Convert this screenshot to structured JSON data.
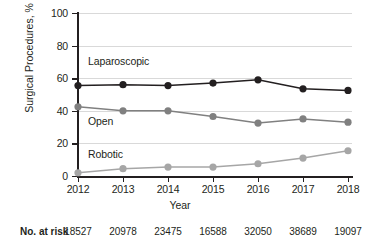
{
  "chart_data": {
    "type": "line",
    "title": "",
    "xlabel": "Year",
    "ylabel": "Surgical Procedures, %",
    "categories": [
      "2012",
      "2013",
      "2014",
      "2015",
      "2016",
      "2017",
      "2018"
    ],
    "xlim": [
      2012,
      2018
    ],
    "ylim": [
      0,
      100
    ],
    "yticks": [
      0,
      20,
      40,
      60,
      80,
      100
    ],
    "ytick_labels": [
      "0",
      "20",
      "40",
      "60",
      "80",
      "100"
    ],
    "grid": "horizontal",
    "legend": "inline-annotations",
    "series": [
      {
        "name": "Laparoscopic",
        "color": "#231f20",
        "values": [
          55.5,
          56.0,
          55.5,
          57.0,
          59.0,
          53.5,
          52.5
        ]
      },
      {
        "name": "Open",
        "color": "#808080",
        "values": [
          42.5,
          40.0,
          40.0,
          36.5,
          32.5,
          35.0,
          33.0
        ]
      },
      {
        "name": "Robotic",
        "color": "#a6a6a6",
        "values": [
          2.0,
          4.5,
          5.5,
          5.5,
          7.5,
          11.0,
          15.5
        ]
      }
    ],
    "annotations": [
      {
        "text": "Laparoscopic",
        "series": "Laparoscopic"
      },
      {
        "text": "Open",
        "series": "Open"
      },
      {
        "text": "Robotic",
        "series": "Robotic"
      }
    ]
  },
  "risk_table": {
    "label": "No. at risk",
    "values": [
      "18527",
      "20978",
      "23475",
      "16588",
      "32050",
      "38689",
      "19097"
    ]
  },
  "colors": {
    "axis": "#231f20",
    "grid": "#d9d9d9",
    "laparoscopic": "#231f20",
    "open": "#808080",
    "robotic": "#a6a6a6",
    "background": "#ffffff"
  }
}
